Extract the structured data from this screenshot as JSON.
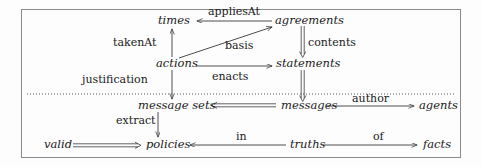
{
  "diagram": {
    "type": "entity-relationship-graph",
    "title": "",
    "frame": {
      "border_color": "#8a8a8a"
    },
    "nodes": [
      {
        "id": "times",
        "label": "times",
        "x": 158,
        "y": 21
      },
      {
        "id": "agreements",
        "label": "agreements",
        "x": 275,
        "y": 21
      },
      {
        "id": "actions",
        "label": "actions",
        "x": 156,
        "y": 63
      },
      {
        "id": "statements",
        "label": "statements",
        "x": 276,
        "y": 63
      },
      {
        "id": "message_sets",
        "label": "message sets",
        "x": 138,
        "y": 106
      },
      {
        "id": "messages",
        "label": "messages",
        "x": 281,
        "y": 106
      },
      {
        "id": "agents",
        "label": "agents",
        "x": 419,
        "y": 106
      },
      {
        "id": "valid",
        "label": "valid",
        "x": 44,
        "y": 143
      },
      {
        "id": "policies",
        "label": "policies",
        "x": 146,
        "y": 143
      },
      {
        "id": "truths",
        "label": "truths",
        "x": 290,
        "y": 143
      },
      {
        "id": "facts",
        "label": "facts",
        "x": 423,
        "y": 143
      }
    ],
    "edges": [
      {
        "id": "appliesAt",
        "label": "appliesAt",
        "from": "agreements",
        "to": "times",
        "style": "single",
        "label_x": 208,
        "label_y": 11
      },
      {
        "id": "basis",
        "label": "basis",
        "from": "actions",
        "to": "agreements",
        "style": "single",
        "label_x": 225,
        "label_y": 44
      },
      {
        "id": "contents",
        "label": "contents",
        "from": "agreements",
        "to": "statements",
        "style": "double",
        "label_x": 309,
        "label_y": 42
      },
      {
        "id": "takenAt",
        "label": "takenAt",
        "from": "actions",
        "to": "times",
        "style": "single",
        "label_x": 114,
        "label_y": 42
      },
      {
        "id": "enacts",
        "label": "enacts",
        "from": "actions",
        "to": "statements",
        "style": "single",
        "label_x": 212,
        "label_y": 75
      },
      {
        "id": "justification",
        "label": "justification",
        "from": "actions",
        "to": "message sets",
        "style": "single",
        "label_x": 83,
        "label_y": 79
      },
      {
        "id": "statements_messages",
        "label": "",
        "from": "statements",
        "to": "messages",
        "style": "double",
        "label_x": 0,
        "label_y": 0
      },
      {
        "id": "message_sets_from_messages",
        "label": "",
        "from": "messages",
        "to": "message sets",
        "style": "double",
        "label_x": 0,
        "label_y": 0
      },
      {
        "id": "author",
        "label": "author",
        "from": "messages",
        "to": "agents",
        "style": "single",
        "label_x": 364,
        "label_y": 97
      },
      {
        "id": "extract",
        "label": "extract",
        "from": "message sets",
        "to": "policies",
        "style": "single",
        "label_x": 121,
        "label_y": 118
      },
      {
        "id": "valid_policies",
        "label": "",
        "from": "valid",
        "to": "policies",
        "style": "double",
        "label_x": 0,
        "label_y": 0
      },
      {
        "id": "in",
        "label": "in",
        "from": "truths",
        "to": "policies",
        "style": "single",
        "label_x": 239,
        "label_y": 133
      },
      {
        "id": "of",
        "label": "of",
        "from": "truths",
        "to": "facts",
        "style": "single",
        "label_x": 373,
        "label_y": 133
      }
    ],
    "separator": {
      "name": "dotted-divider",
      "y": 94,
      "x1": 27,
      "x2": 455
    }
  }
}
